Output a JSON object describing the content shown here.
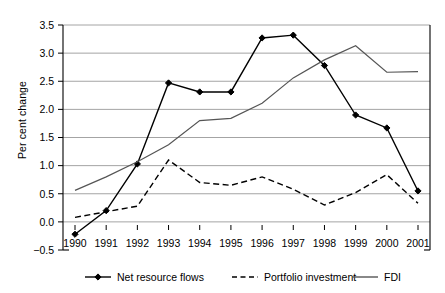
{
  "chart_data": {
    "type": "line",
    "title": "",
    "xlabel": "",
    "ylabel": "Per cent change",
    "categories": [
      "1990",
      "1991",
      "1992",
      "1993",
      "1994",
      "1995",
      "1996",
      "1997",
      "1998",
      "1999",
      "2000",
      "2001"
    ],
    "x": [
      1990,
      1991,
      1992,
      1993,
      1994,
      1995,
      1996,
      1997,
      1998,
      1999,
      2000,
      2001
    ],
    "ylim": [
      -0.5,
      3.5
    ],
    "yticks": [
      "-0.5",
      "0.0",
      "0.5",
      "1.0",
      "1.5",
      "2.0",
      "2.5",
      "3.0",
      "3.5"
    ],
    "ytick_values": [
      -0.5,
      0.0,
      0.5,
      1.0,
      1.5,
      2.0,
      2.5,
      3.0,
      3.5
    ],
    "grid": true,
    "legend_position": "bottom",
    "series": [
      {
        "name": "Net resource flows",
        "style": "solid-with-diamond-markers",
        "color": "#000000",
        "values": [
          -0.22,
          0.2,
          1.03,
          2.47,
          2.31,
          2.31,
          3.27,
          3.32,
          2.78,
          1.9,
          1.67,
          0.55
        ]
      },
      {
        "name": "Portfolio investment",
        "style": "dashed",
        "color": "#000000",
        "values": [
          0.08,
          0.18,
          0.28,
          1.1,
          0.7,
          0.65,
          0.8,
          0.58,
          0.3,
          0.52,
          0.84,
          0.33
        ]
      },
      {
        "name": "FDI",
        "style": "solid",
        "color": "#555555",
        "values": [
          0.56,
          0.8,
          1.07,
          1.37,
          1.8,
          1.84,
          2.11,
          2.56,
          2.88,
          3.13,
          2.66,
          2.67
        ]
      }
    ]
  },
  "axes": {
    "y_title": "Per cent change"
  },
  "legend": {
    "items": [
      {
        "label": "Net resource flows",
        "marker": "line-diamond-icon"
      },
      {
        "label": "Portfolio investment",
        "marker": "dashed-line-icon"
      },
      {
        "label": "FDI",
        "marker": "solid-line-icon"
      }
    ]
  }
}
